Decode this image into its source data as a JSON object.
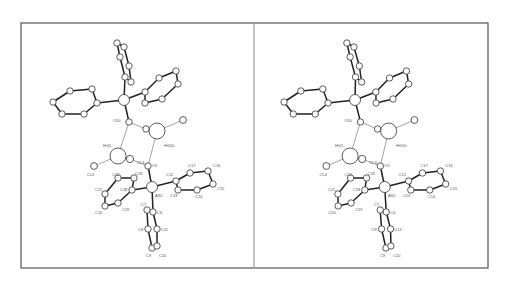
{
  "figure": {
    "type": "stereo-pair-crystal-structure",
    "panels": [
      "left",
      "right"
    ],
    "frame": {
      "x": 21,
      "y": 23,
      "width": 467,
      "height": 245,
      "divider_x": 254
    },
    "stereo_offset_x": 232,
    "colors": {
      "line": "#222222",
      "frame": "#555555",
      "atom_fill": "#ffffff",
      "label": "#555555"
    }
  },
  "atoms": [
    {
      "id": "P1",
      "x": 124,
      "y": 100,
      "r": 5.5
    },
    {
      "id": "a1",
      "x": 53,
      "y": 102,
      "r": 3.2
    },
    {
      "id": "a2",
      "x": 70,
      "y": 91,
      "r": 3.2
    },
    {
      "id": "a3",
      "x": 92,
      "y": 89,
      "r": 3.2
    },
    {
      "id": "a4",
      "x": 97,
      "y": 103,
      "r": 3.2
    },
    {
      "id": "a5",
      "x": 84,
      "y": 114,
      "r": 3.2
    },
    {
      "id": "a6",
      "x": 62,
      "y": 114,
      "r": 3.2
    },
    {
      "id": "b1",
      "x": 117,
      "y": 43,
      "r": 3.2
    },
    {
      "id": "b2",
      "x": 124,
      "y": 47,
      "r": 3.2
    },
    {
      "id": "b3",
      "x": 120,
      "y": 57,
      "r": 3.2
    },
    {
      "id": "b4",
      "x": 129,
      "y": 66,
      "r": 3.2
    },
    {
      "id": "b5",
      "x": 125,
      "y": 77,
      "r": 3.2
    },
    {
      "id": "b6",
      "x": 131,
      "y": 82,
      "r": 3.2
    },
    {
      "id": "c1",
      "x": 145,
      "y": 92,
      "r": 3.2
    },
    {
      "id": "c2",
      "x": 159,
      "y": 78,
      "r": 3.2
    },
    {
      "id": "c3",
      "x": 176,
      "y": 71,
      "r": 3.2
    },
    {
      "id": "c4",
      "x": 178,
      "y": 84,
      "r": 3.2
    },
    {
      "id": "c5",
      "x": 162,
      "y": 99,
      "r": 3.2
    },
    {
      "id": "c6",
      "x": 145,
      "y": 103,
      "r": 3.2
    },
    {
      "id": "O50",
      "x": 129,
      "y": 122,
      "r": 3.2
    },
    {
      "id": "w1",
      "x": 146,
      "y": 129,
      "r": 3.2
    },
    {
      "id": "HG10",
      "x": 157,
      "y": 131,
      "r": 8
    },
    {
      "id": "w2",
      "x": 183,
      "y": 120,
      "r": 3.4
    },
    {
      "id": "HG1",
      "x": 118,
      "y": 156,
      "r": 8
    },
    {
      "id": "w3",
      "x": 130,
      "y": 159,
      "r": 3.6
    },
    {
      "id": "CL4",
      "x": 94,
      "y": 166,
      "r": 3.4
    },
    {
      "id": "O5",
      "x": 148,
      "y": 166,
      "r": 3.2
    },
    {
      "id": "AS2",
      "x": 152,
      "y": 187,
      "r": 5.5
    },
    {
      "id": "C23",
      "x": 134,
      "y": 178,
      "r": 3.2
    },
    {
      "id": "C22",
      "x": 118,
      "y": 178,
      "r": 3.2
    },
    {
      "id": "C21",
      "x": 105,
      "y": 194,
      "r": 3.2
    },
    {
      "id": "C20",
      "x": 105,
      "y": 206,
      "r": 3.2
    },
    {
      "id": "C19",
      "x": 118,
      "y": 203,
      "r": 3.2
    },
    {
      "id": "C18",
      "x": 132,
      "y": 190,
      "r": 3.2
    },
    {
      "id": "C12",
      "x": 176,
      "y": 181,
      "r": 3.2
    },
    {
      "id": "C17",
      "x": 190,
      "y": 173,
      "r": 3.2
    },
    {
      "id": "C16",
      "x": 208,
      "y": 171,
      "r": 3.2
    },
    {
      "id": "C15",
      "x": 213,
      "y": 184,
      "r": 3.2
    },
    {
      "id": "C14",
      "x": 197,
      "y": 190,
      "r": 3.2
    },
    {
      "id": "C13",
      "x": 178,
      "y": 190,
      "r": 3.2
    },
    {
      "id": "C7",
      "x": 147,
      "y": 210,
      "r": 3.2
    },
    {
      "id": "C6",
      "x": 153,
      "y": 212,
      "r": 3.2
    },
    {
      "id": "C8",
      "x": 148,
      "y": 229,
      "r": 3.2
    },
    {
      "id": "C11",
      "x": 157,
      "y": 229,
      "r": 3.2
    },
    {
      "id": "C9",
      "x": 152,
      "y": 248,
      "r": 3.2
    },
    {
      "id": "C10",
      "x": 157,
      "y": 246,
      "r": 3.2
    }
  ],
  "bonds": [
    [
      "P1",
      "a4"
    ],
    [
      "a1",
      "a2"
    ],
    [
      "a2",
      "a3"
    ],
    [
      "a3",
      "a4"
    ],
    [
      "a4",
      "a5"
    ],
    [
      "a5",
      "a6"
    ],
    [
      "a6",
      "a1"
    ],
    [
      "P1",
      "b5"
    ],
    [
      "b1",
      "b2"
    ],
    [
      "b2",
      "b4"
    ],
    [
      "b4",
      "b6"
    ],
    [
      "b6",
      "b5"
    ],
    [
      "b5",
      "b3"
    ],
    [
      "b3",
      "b1"
    ],
    [
      "P1",
      "c1"
    ],
    [
      "c1",
      "c2"
    ],
    [
      "c2",
      "c3"
    ],
    [
      "c3",
      "c4"
    ],
    [
      "c4",
      "c5"
    ],
    [
      "c5",
      "c6"
    ],
    [
      "c6",
      "c1"
    ],
    [
      "P1",
      "O50"
    ],
    [
      "AS2",
      "O5"
    ],
    [
      "AS2",
      "C18"
    ],
    [
      "C18",
      "C23"
    ],
    [
      "C23",
      "C22"
    ],
    [
      "C22",
      "C21"
    ],
    [
      "C21",
      "C20"
    ],
    [
      "C20",
      "C19"
    ],
    [
      "C19",
      "C18"
    ],
    [
      "AS2",
      "C12"
    ],
    [
      "C12",
      "C17"
    ],
    [
      "C17",
      "C16"
    ],
    [
      "C16",
      "C15"
    ],
    [
      "C15",
      "C14"
    ],
    [
      "C14",
      "C13"
    ],
    [
      "C13",
      "C12"
    ],
    [
      "AS2",
      "C6"
    ],
    [
      "C6",
      "C11"
    ],
    [
      "C11",
      "C10"
    ],
    [
      "C10",
      "C9"
    ],
    [
      "C9",
      "C8"
    ],
    [
      "C8",
      "C7"
    ],
    [
      "C7",
      "C6"
    ]
  ],
  "thin_bonds": [
    [
      "O50",
      "w1"
    ],
    [
      "w1",
      "HG10"
    ],
    [
      "HG10",
      "w2"
    ],
    [
      "O50",
      "HG1"
    ],
    [
      "HG10",
      "O5"
    ],
    [
      "HG1",
      "w3"
    ],
    [
      "HG1",
      "CL4"
    ],
    [
      "w3",
      "O5"
    ]
  ],
  "labels": [
    {
      "text": "O50",
      "x": 113,
      "y": 122
    },
    {
      "text": "HG10",
      "x": 164,
      "y": 147
    },
    {
      "text": "HG1",
      "x": 103,
      "y": 147
    },
    {
      "text": "CL3",
      "x": 137,
      "y": 164
    },
    {
      "text": "O5",
      "x": 152,
      "y": 167
    },
    {
      "text": "CL4",
      "x": 87,
      "y": 176
    },
    {
      "text": "C23",
      "x": 135,
      "y": 175
    },
    {
      "text": "C22",
      "x": 112,
      "y": 176
    },
    {
      "text": "C21",
      "x": 95,
      "y": 191
    },
    {
      "text": "C18",
      "x": 120,
      "y": 191
    },
    {
      "text": "C19",
      "x": 122,
      "y": 211
    },
    {
      "text": "C20",
      "x": 95,
      "y": 214
    },
    {
      "text": "AS2",
      "x": 155,
      "y": 197
    },
    {
      "text": "C12",
      "x": 166,
      "y": 176
    },
    {
      "text": "C17",
      "x": 188,
      "y": 167
    },
    {
      "text": "C16",
      "x": 213,
      "y": 167
    },
    {
      "text": "C15",
      "x": 217,
      "y": 190
    },
    {
      "text": "C14",
      "x": 195,
      "y": 198
    },
    {
      "text": "C13",
      "x": 170,
      "y": 197
    },
    {
      "text": "C7",
      "x": 141,
      "y": 206
    },
    {
      "text": "C6",
      "x": 157,
      "y": 214
    },
    {
      "text": "C8",
      "x": 138,
      "y": 231
    },
    {
      "text": "C11",
      "x": 161,
      "y": 231
    },
    {
      "text": "C9",
      "x": 146,
      "y": 257
    },
    {
      "text": "C10",
      "x": 159,
      "y": 257
    }
  ]
}
